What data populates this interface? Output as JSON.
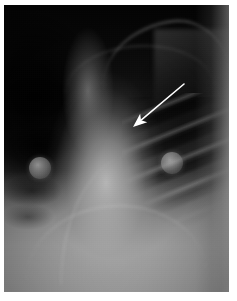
{
  "image": {
    "kind": "chest-radiograph",
    "modality": "X-ray",
    "view": "frontal (AP/PA) chest",
    "alt_text": "Frontal chest radiograph with a white arrow annotation pointing to an abnormality in the left upper-mid lung zone; two circular ECG electrode artifacts are visible overlying the chest.",
    "width_px": 237,
    "height_px": 301
  },
  "canvas": {
    "page_background": "#ffffff",
    "plate_left": 4,
    "plate_top": 5,
    "plate_width": 225,
    "plate_height": 287,
    "plate_background": "#050505"
  },
  "regions": [
    {
      "name": "right-lung-field",
      "label": "Right lung field (image left) — markedly lucent/dark",
      "tone": "#060606"
    },
    {
      "name": "mediastinum",
      "label": "Mediastinum / cardiac silhouette — bright opacity",
      "tone": "#b4b4b4"
    },
    {
      "name": "left-lung-field",
      "label": "Left lung field (image right) — rib cage visible",
      "tone": "#3a3a3a"
    },
    {
      "name": "diaphragm",
      "label": "Diaphragm / upper abdomen",
      "tone": "#909090"
    },
    {
      "name": "lateral-chest-wall",
      "label": "Lateral chest wall soft tissue",
      "tone": "#a8a8a8"
    },
    {
      "name": "clavicle",
      "label": "Clavicle",
      "tone": "#969696"
    },
    {
      "name": "scapula",
      "label": "Scapula / shoulder",
      "tone": "#8c8c8c"
    }
  ],
  "annotations": {
    "arrow": {
      "name": "finding-arrow",
      "color": "#ffffff",
      "tail_x": 180,
      "tail_y": 79,
      "tip_x": 129,
      "tip_y": 122,
      "shaft_width": 1.6,
      "head_length": 14,
      "head_width": 11,
      "points_to": "left upper-mid lung zone lesion"
    }
  },
  "artifacts": [
    {
      "name": "ecg-electrode-left",
      "label": "ECG electrode disc",
      "center_x": 36,
      "center_y": 163,
      "radius": 11,
      "color": "#c8c8c8"
    },
    {
      "name": "ecg-electrode-right",
      "label": "ECG electrode disc",
      "center_x": 168,
      "center_y": 158,
      "radius": 11,
      "color": "#c8c8c8"
    }
  ],
  "palette": {
    "page": "#ffffff",
    "film_darkest": "#040404",
    "film_mid": "#535353",
    "film_bright": "#8f8f8f",
    "opacity_bright": "#d2d2d2",
    "annotation": "#ffffff"
  }
}
